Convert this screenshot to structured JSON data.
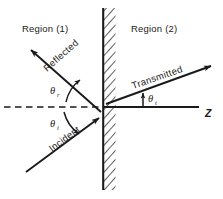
{
  "figure": {
    "colors": {
      "ink": "#1a1a1a",
      "background": "#ffffff"
    },
    "regions": [
      {
        "id": "region-1",
        "label": "Region  (1)",
        "x": 22,
        "y": 32
      },
      {
        "id": "region-2",
        "label": "Region  (2)",
        "x": 131,
        "y": 32
      }
    ],
    "rays": [
      {
        "id": "incident-ray",
        "label": "Incident",
        "angle_deg": -36.5,
        "label_x": 52,
        "label_y": 152
      },
      {
        "id": "reflected-ray",
        "label": "Reflected",
        "angle_deg": -36.5,
        "label_x": 47,
        "label_y": 72
      },
      {
        "id": "transmitted-ray",
        "label": "Transmitted",
        "angle_deg": -13.5,
        "label_x": 133,
        "label_y": 89
      }
    ],
    "angles": [
      {
        "id": "theta-r",
        "symbol": "θ",
        "subscript": "r",
        "x": 50,
        "y": 94,
        "meaning": "angle of reflection"
      },
      {
        "id": "theta-i",
        "symbol": "θ",
        "subscript": "i",
        "x": 50,
        "y": 127,
        "meaning": "angle of incidence"
      },
      {
        "id": "theta-t",
        "symbol": "θ",
        "subscript": "t",
        "x": 148,
        "y": 102,
        "meaning": "angle of transmission"
      }
    ],
    "axis": {
      "id": "z-axis",
      "label": "Z",
      "label_x": 205,
      "label_y": 117
    },
    "boundary": {
      "id": "interface-boundary",
      "x": 103,
      "y_top": 8,
      "y_bottom": 190,
      "hatch_side": "right",
      "hatch_label": "hatched-interface"
    },
    "normal_line": {
      "id": "surface-normal-dashed",
      "style": "dashed",
      "y": 107,
      "x_start": 4,
      "x_end": 103
    }
  }
}
